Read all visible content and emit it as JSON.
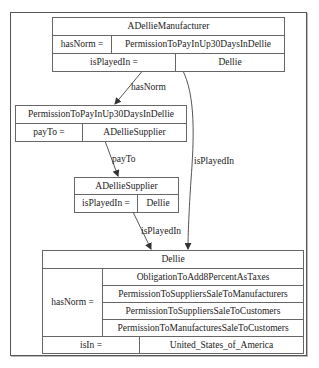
{
  "nodes": {
    "manufacturer": {
      "title": "ADellieManufacturer",
      "rows": [
        {
          "key": "hasNorm =",
          "value": "PermissionToPayInUp30DaysInDellie"
        },
        {
          "key": "isPlayedIn =",
          "value": "Dellie"
        }
      ]
    },
    "permission": {
      "title": "PermissionToPayInUp30DaysInDellie",
      "rows": [
        {
          "key": "payTo =",
          "value": "ADellieSupplier"
        }
      ]
    },
    "supplier": {
      "title": "ADellieSupplier",
      "rows": [
        {
          "key": "isPlayedIn =",
          "value": "Dellie"
        }
      ]
    },
    "dellie": {
      "title": "Dellie",
      "hasNorm_key": "hasNorm =",
      "hasNorm_values": [
        "ObligationToAdd8PercentAsTaxes",
        "PermissionToSuppliersSaleToManufacturers",
        "PermissionToSuppliersSaleToCustomers",
        "PermissionToManufacturesSaleToCustomers"
      ],
      "isIn_key": "isIn =",
      "isIn_value": "United_States_of_America"
    }
  },
  "edges": [
    {
      "from": "manufacturer",
      "to": "permission",
      "label": "hasNorm"
    },
    {
      "from": "permission",
      "to": "supplier",
      "label": "payTo"
    },
    {
      "from": "supplier",
      "to": "dellie",
      "label": "isPlayedIn"
    },
    {
      "from": "manufacturer",
      "to": "dellie",
      "label": "isPlayedIn"
    }
  ],
  "colors": {
    "border": "#666666",
    "edge": "#555555",
    "background": "#ffffff"
  }
}
